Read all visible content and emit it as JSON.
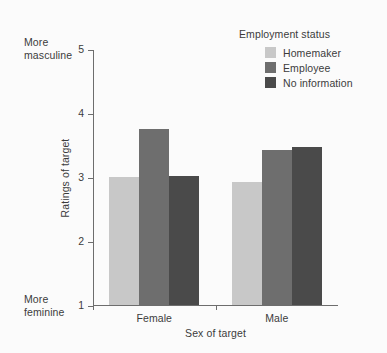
{
  "chart_data": {
    "type": "bar",
    "title": "",
    "xlabel": "Sex of target",
    "ylabel": "Ratings of target",
    "categories": [
      "Female",
      "Male"
    ],
    "series": [
      {
        "name": "Homemaker",
        "values": [
          3.0,
          2.92
        ],
        "color": "#c8c8c8"
      },
      {
        "name": "Employee",
        "values": [
          3.75,
          3.42
        ],
        "color": "#6e6e6e"
      },
      {
        "name": "No information",
        "values": [
          3.02,
          3.47
        ],
        "color": "#4a4a4a"
      }
    ],
    "ylim": [
      1,
      5
    ],
    "yticks": [
      1,
      2,
      3,
      4,
      5
    ],
    "ytick_labels": [
      "1",
      "2",
      "3",
      "4",
      "5"
    ],
    "grid": false,
    "legend": {
      "title": "Employment status",
      "position": "top-right"
    },
    "annotations": {
      "y_axis_top": "More\nmasculine",
      "y_axis_bottom": "More\nfeminine"
    }
  },
  "colors": {
    "background": "#fbfbfb",
    "axis": "#6d6d6d",
    "text": "#3b3b3b",
    "homemaker": "#c8c8c8",
    "employee": "#6e6e6e",
    "no_information": "#4a4a4a"
  }
}
